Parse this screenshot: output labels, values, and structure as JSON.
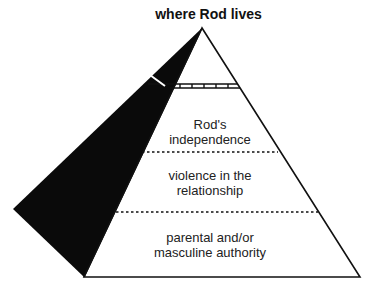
{
  "title": "where Rod lives",
  "levels": [
    {
      "label_line1": "Rod's",
      "label_line2": "independence"
    },
    {
      "label_line1": "violence in the",
      "label_line2": "relationship"
    },
    {
      "label_line1": "parental and/or",
      "label_line2": "masculine authority"
    }
  ],
  "colors": {
    "line": "#111111",
    "shadow": "#0a0a0a",
    "text": "#222222"
  }
}
